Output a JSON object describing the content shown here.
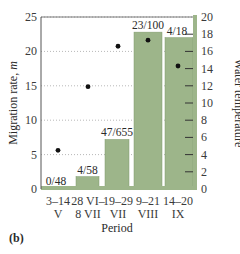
{
  "chart_data": {
    "type": "bar",
    "title": "",
    "panel_label": "(b)",
    "xlabel": "Period",
    "ylabel": "Migration rate, m",
    "y2label": "Water temperature",
    "categories": [
      {
        "line1": "3–14",
        "line2": "V"
      },
      {
        "line1": "28 VI–",
        "line2": "8 VII"
      },
      {
        "line1": "19–29",
        "line2": "VII"
      },
      {
        "line1": "9–21",
        "line2": "VIII"
      },
      {
        "line1": "14–20",
        "line2": "IX"
      }
    ],
    "series": [
      {
        "name": "Migration rate",
        "axis": "left",
        "kind": "bar",
        "values": [
          0,
          1.8,
          7.2,
          22.8,
          22.0
        ],
        "labels": [
          "0/48",
          "4/58",
          "47/655",
          "23/100",
          "4/18"
        ]
      },
      {
        "name": "Water temperature",
        "axis": "right",
        "kind": "scatter",
        "values": [
          4.5,
          11.9,
          16.6,
          17.3,
          14.3
        ]
      }
    ],
    "ylim": [
      0,
      25
    ],
    "yticks": [
      0,
      5,
      10,
      15,
      20,
      25
    ],
    "y2lim": [
      0,
      20
    ],
    "y2ticks": [
      0,
      2,
      4,
      6,
      8,
      10,
      12,
      14,
      16,
      18,
      20
    ],
    "grid": "horizontal dotted at left-axis ticks",
    "colors": {
      "bar": "#9db58a",
      "bar_edge": "#7f9a6c",
      "axis_band": "#9db58a",
      "dot": "#111111"
    }
  }
}
